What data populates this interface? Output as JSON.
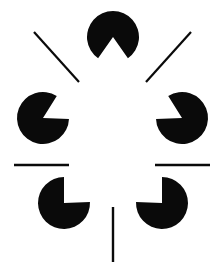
{
  "canvas": {
    "width": 222,
    "height": 273,
    "background_color": "#ffffff",
    "ink_color": "#0a0a0a",
    "title": "Kanizsa illusory pentagon figure"
  },
  "figure": {
    "type": "kanizsa-illusory-contour",
    "inducer_count": 5,
    "line_count": 5,
    "illusory_shape": "pentagon",
    "center": {
      "x": 113,
      "y": 130
    }
  },
  "pacmen": [
    {
      "id": "pacman-top",
      "label": "top inducer",
      "cx": 113,
      "cy": 37,
      "r": 26,
      "wedge_start_deg": 55,
      "wedge_end_deg": 125,
      "notch_direction": "down"
    },
    {
      "id": "pacman-left-middle",
      "label": "left middle inducer",
      "cx": 43,
      "cy": 118,
      "r": 26,
      "wedge_start_deg": -58,
      "wedge_end_deg": 2,
      "notch_direction": "up-right"
    },
    {
      "id": "pacman-right-middle",
      "label": "right middle inducer",
      "cx": 182,
      "cy": 118,
      "r": 26,
      "wedge_start_deg": 178,
      "wedge_end_deg": 238,
      "notch_direction": "up-left"
    },
    {
      "id": "pacman-bottom-left",
      "label": "bottom left inducer",
      "cx": 64,
      "cy": 203,
      "r": 26,
      "wedge_start_deg": -90,
      "wedge_end_deg": -2,
      "notch_direction": "up-right"
    },
    {
      "id": "pacman-bottom-right",
      "label": "bottom right inducer",
      "cx": 162,
      "cy": 203,
      "r": 26,
      "wedge_start_deg": 182,
      "wedge_end_deg": 270,
      "notch_direction": "up-left"
    }
  ],
  "lines": [
    {
      "id": "line-upper-left-diagonal",
      "label": "upper left radiating segment",
      "x1": 34,
      "y1": 32,
      "x2": 79,
      "y2": 82,
      "width": 2.2,
      "orientation": "diagonal-down-right"
    },
    {
      "id": "line-upper-right-diagonal",
      "label": "upper right radiating segment",
      "x1": 191,
      "y1": 32,
      "x2": 146,
      "y2": 82,
      "width": 2.2,
      "orientation": "diagonal-down-left"
    },
    {
      "id": "line-left-horizontal",
      "label": "left horizontal segment",
      "x1": 14,
      "y1": 165,
      "x2": 69,
      "y2": 165,
      "width": 2.4,
      "orientation": "horizontal"
    },
    {
      "id": "line-right-horizontal",
      "label": "right horizontal segment",
      "x1": 155,
      "y1": 165,
      "x2": 210,
      "y2": 165,
      "width": 2.4,
      "orientation": "horizontal"
    },
    {
      "id": "line-bottom-vertical",
      "label": "bottom vertical segment",
      "x1": 113,
      "y1": 207,
      "x2": 113,
      "y2": 262,
      "width": 2.4,
      "orientation": "vertical"
    }
  ]
}
